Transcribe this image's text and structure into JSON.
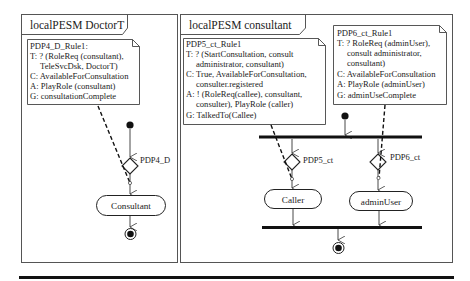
{
  "frames": {
    "doctor": {
      "title": "localPESM DoctorT"
    },
    "consultant": {
      "title": "localPESM consultant"
    }
  },
  "notes": {
    "pdp4": {
      "lines": [
        "PDP4_D_Rule1:",
        "T: ? (RoleReq (consultant),",
        "    TeleSvcDsk, DoctorT)",
        "C: AvailableForConsultation",
        "A: PlayRole (consultant)",
        "G: consultationComplete"
      ]
    },
    "pdp5": {
      "lines": [
        "PDP5_ct_Rule1",
        "T: ? (StartConsultation, consult",
        "    administrator, consultant)",
        "C: True, AvailableForConsultation,",
        "    consulter.registered",
        "A: ! (RoleReq(callee), consultant,",
        "    consulter), PlayRole (caller)",
        "G: TalkedTo(Callee)"
      ]
    },
    "pdp6": {
      "lines": [
        "PDP6_ct_Rule1",
        "T: ? RoleReq (adminUser),",
        "    consult administrator,",
        "    consultant)",
        "C: AvailableForConsultation",
        "A: PlayRole (adminUser)",
        "G: adminUseComplete"
      ]
    }
  },
  "decisions": {
    "pdp4": "PDP4_D",
    "pdp5": "PDP5_ct",
    "pdp6": "PDP6_ct"
  },
  "activities": {
    "consultant": "Consultant",
    "caller": "Caller",
    "admin_user": "adminUser"
  },
  "colors": {
    "line": "#222222",
    "background": "#ffffff"
  }
}
